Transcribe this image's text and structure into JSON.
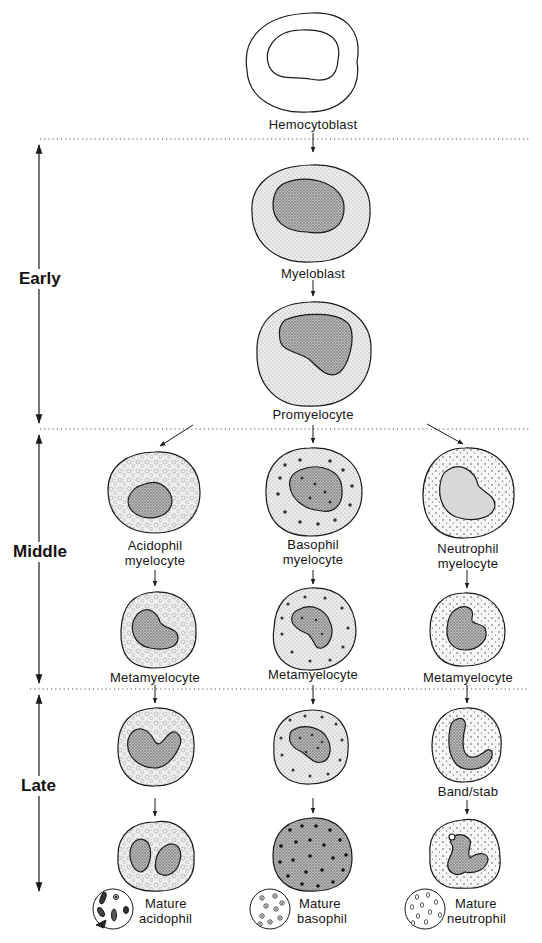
{
  "stages": [
    {
      "id": "early",
      "label": "Early"
    },
    {
      "id": "middle",
      "label": "Middle"
    },
    {
      "id": "late",
      "label": "Late"
    }
  ],
  "cells": {
    "hemocytoblast": "Hemocytoblast",
    "myeloblast": "Myeloblast",
    "promyelocyte": "Promyelocyte",
    "acidophil_myelocyte": [
      "Acidophil",
      "myelocyte"
    ],
    "basophil_myelocyte": [
      "Basophil",
      "myelocyte"
    ],
    "neutrophil_myelocyte": [
      "Neutrophil",
      "myelocyte"
    ],
    "acidophil_metamyelocyte": "Metamyelocyte",
    "basophil_metamyelocyte": "Metamyelocyte",
    "neutrophil_metamyelocyte": "Metamyelocyte",
    "band_stab": "Band/stab",
    "mature_acidophil": [
      "Mature",
      "acidophil"
    ],
    "mature_basophil": [
      "Mature",
      "basophil"
    ],
    "mature_neutrophil": [
      "Mature",
      "neutrophil"
    ]
  },
  "lineages": [
    "acidophil",
    "basophil",
    "neutrophil"
  ],
  "colors": {
    "ink": "#1a1a1a",
    "stipple": "#9a9a9a",
    "divider": "#555555"
  }
}
